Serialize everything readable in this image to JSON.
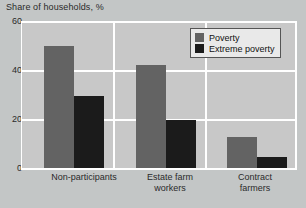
{
  "chart_data": {
    "type": "bar",
    "title": "Share of households, %",
    "xlabel": "",
    "ylabel": "",
    "ylim": [
      0,
      60
    ],
    "yticks": [
      0,
      20,
      40,
      60
    ],
    "ytick_labels": [
      "0",
      "20",
      "40",
      "60"
    ],
    "grid": true,
    "legend_position": "top-right",
    "categories": [
      "Non-participants",
      "Estate farm workers",
      "Contract farmers"
    ],
    "category_label_lines": [
      [
        "Non-participants"
      ],
      [
        "Estate farm",
        "workers"
      ],
      [
        "Contract",
        "farmers"
      ]
    ],
    "series": [
      {
        "name": "Poverty",
        "color": "#636363",
        "values": [
          50,
          42,
          13
        ]
      },
      {
        "name": "Extreme poverty",
        "color": "#1b1b1b",
        "values": [
          29.5,
          20,
          5
        ]
      }
    ]
  },
  "colors": {
    "page_background": "#c3c6c6",
    "plot_background": "#c8c8c8",
    "gridline": "#ffffff",
    "text": "#2a2a2a",
    "legend_background": "#e9e9e9",
    "legend_border": "#555555"
  }
}
